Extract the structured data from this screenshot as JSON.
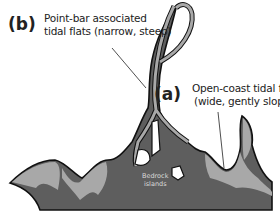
{
  "labels": {
    "b": {
      "letter": "(b)",
      "line1": "Point-bar associated",
      "line2": "tidal flats (narrow, steep)"
    },
    "a": {
      "letter": "(a)",
      "line1": "Open-coast tidal flats",
      "line2": "(wide, gently sloping)"
    },
    "bedrock": {
      "line1": "Bedrock",
      "line2": "islands"
    }
  },
  "colors": {
    "water": "#ffffff",
    "tidal_flat_light": "#a8a8a8",
    "land_dark": "#5e5e5e",
    "land_mid": "#787878",
    "outline": "#111111"
  }
}
